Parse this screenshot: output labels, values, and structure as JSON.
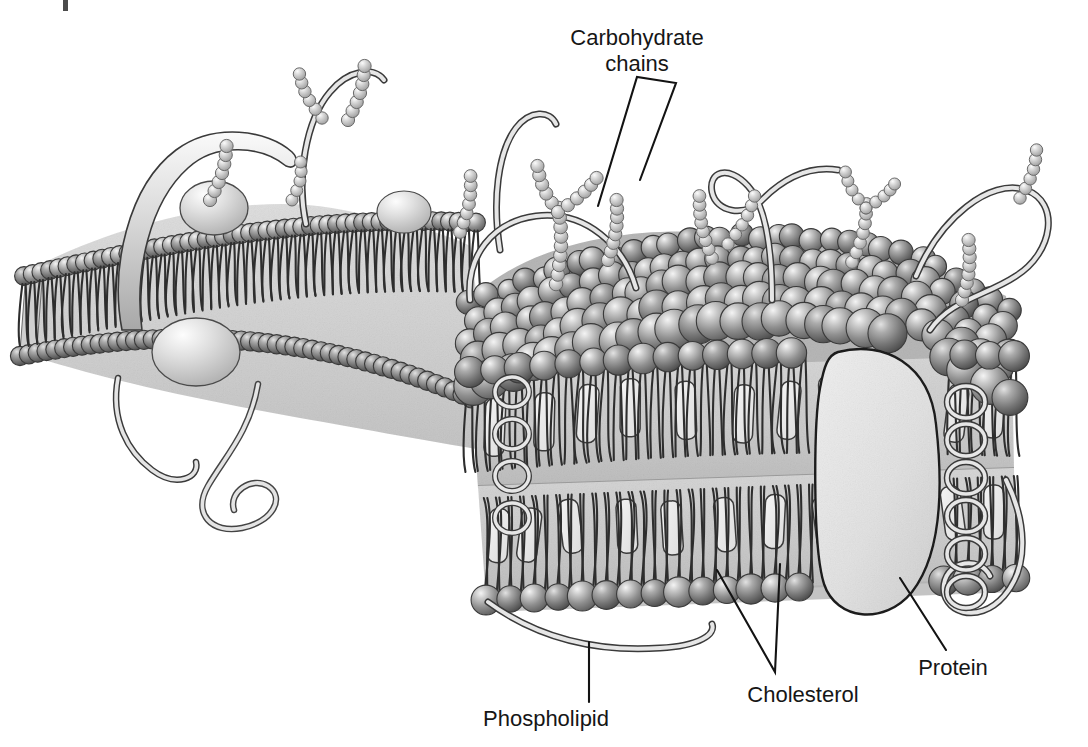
{
  "figure": {
    "kind": "scientific-illustration",
    "style": "grayscale pencil/airbrush textbook art",
    "background_color": "#ffffff",
    "width": 1088,
    "height": 747
  },
  "labels": [
    {
      "id": "carbohydrate-chains",
      "line1": "Carbohydrate",
      "line2": "chains",
      "text": "Carbohydrate chains",
      "x": 637,
      "y": 40,
      "align": "center",
      "leader": "two-pronged V descending to two beaded chains"
    },
    {
      "id": "protein",
      "line1": "Protein",
      "line2": "",
      "text": "Protein",
      "x": 953,
      "y": 668,
      "align": "center",
      "leader": "single diagonal line up-left to large oval protein"
    },
    {
      "id": "phospholipid",
      "line1": "Phospholipid",
      "line2": "",
      "text": "Phospholipid",
      "x": 546,
      "y": 719,
      "align": "center",
      "leader": "single vertical line up to a lipid head sphere"
    },
    {
      "id": "cholesterol",
      "line1": "Cholesterol",
      "line2": "",
      "text": "Cholesterol",
      "x": 803,
      "y": 695,
      "align": "center",
      "leader": "two-pronged V rising to two cholesterol slabs"
    }
  ],
  "colors": {
    "ink": "#131313",
    "label_text": "#161616",
    "head_dark": "#6f6f6f",
    "head_mid": "#8d8d8d",
    "head_light": "#c9c9c9",
    "head_highlight": "#f2f2f2",
    "tail_stroke": "#2e2e2e",
    "interior_fill": "#d9d9d9",
    "interior_fill_deep": "#c2c2c2",
    "cholesterol_fill": "#ececec",
    "protein_fill": "#e3e3e3",
    "protein_stroke": "#1b1b1b",
    "carb_bead": "#b9b9b9",
    "tube_fill": "#dddddd",
    "tube_stroke": "#3a3a3a"
  },
  "structures": {
    "bilayer": {
      "name": "phospholipid bilayer",
      "leaflets": 2,
      "head_description": "shaded spheres forming the polar head rows",
      "tail_description": "paired hydrophobic fatty-acid tails"
    },
    "cholesterol": {
      "name": "cholesterol",
      "description": "pale rounded slabs wedged between the fatty-acid tails",
      "count_visible": 14
    },
    "integral_protein": {
      "name": "protein",
      "description": "large pale oval spanning the bilayer on the right"
    },
    "glycoproteins": {
      "name": "glycoprotein tubes",
      "description": "ribbon-like tubes with loops and coils emerging from the membrane"
    },
    "carbohydrate_chains": {
      "name": "carbohydrate chains",
      "description": "branching strings of small pale beads on the outer surface",
      "count_visible": 11
    }
  },
  "artifact": {
    "name": "scan-mark",
    "description": "small dark scanning artifact near the top edge"
  }
}
